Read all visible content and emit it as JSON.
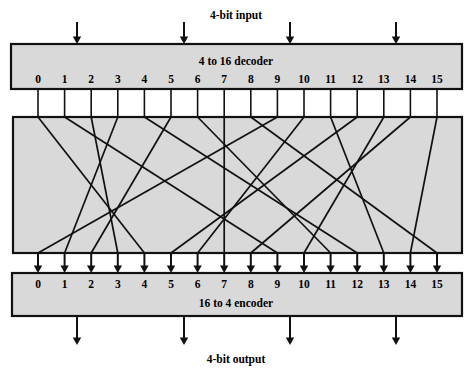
{
  "figure": {
    "title_top": "4-bit input",
    "title_bottom": "4-bit output",
    "type": "logic-block-diagram"
  },
  "decoder": {
    "label": "4 to 16 decoder",
    "input_count": 4,
    "output_count": 16,
    "port_labels": [
      "0",
      "1",
      "2",
      "3",
      "4",
      "5",
      "6",
      "7",
      "8",
      "9",
      "10",
      "11",
      "12",
      "13",
      "14",
      "15"
    ]
  },
  "crossbar": {
    "label": "",
    "description": "permutation wiring between decoder outputs and encoder inputs",
    "mapping": [
      {
        "from": 0,
        "to": 4
      },
      {
        "from": 1,
        "to": 9
      },
      {
        "from": 2,
        "to": 3
      },
      {
        "from": 3,
        "to": 1
      },
      {
        "from": 4,
        "to": 12
      },
      {
        "from": 5,
        "to": 2
      },
      {
        "from": 6,
        "to": 11
      },
      {
        "from": 7,
        "to": 7
      },
      {
        "from": 8,
        "to": 15
      },
      {
        "from": 9,
        "to": 0
      },
      {
        "from": 10,
        "to": 6
      },
      {
        "from": 11,
        "to": 13
      },
      {
        "from": 12,
        "to": 5
      },
      {
        "from": 13,
        "to": 10
      },
      {
        "from": 14,
        "to": 8
      },
      {
        "from": 15,
        "to": 14
      }
    ]
  },
  "encoder": {
    "label": "16 to 4 encoder",
    "input_count": 16,
    "output_count": 4,
    "port_labels": [
      "0",
      "1",
      "2",
      "3",
      "4",
      "5",
      "6",
      "7",
      "8",
      "9",
      "10",
      "11",
      "12",
      "13",
      "14",
      "15"
    ]
  },
  "colors": {
    "block_fill": "#d9d9d9",
    "line": "#111111",
    "background": "#ffffff"
  },
  "geometry": {
    "port_first_x": 38,
    "port_spacing": 26.6,
    "decoder_box": {
      "x": 11,
      "y": 44,
      "w": 451,
      "h": 45
    },
    "crossbar_box": {
      "x": 13,
      "y": 117,
      "w": 449,
      "h": 136
    },
    "encoder_box": {
      "x": 12,
      "y": 273,
      "w": 450,
      "h": 43
    },
    "input_arrow_x": [
      77,
      184,
      290,
      396
    ],
    "output_arrow_x": [
      77,
      184,
      290,
      396
    ]
  }
}
